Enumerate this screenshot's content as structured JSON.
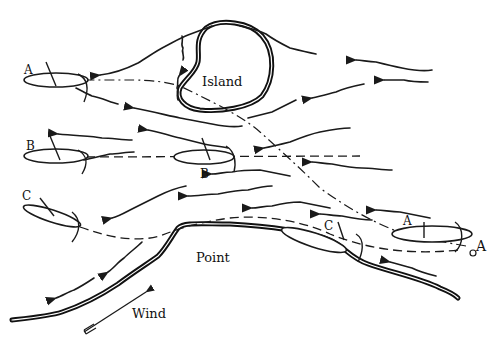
{
  "figure": {
    "landmarks": {
      "island_label": "Island",
      "point_label": "Point",
      "wind_label": "Wind"
    },
    "boats": {
      "a_start_label": "A",
      "a_end_label": "A",
      "a_mark_label": "A",
      "b_start_label": "B",
      "b_end_label": "B",
      "c_start_label": "C",
      "c_end_label": "C"
    },
    "colors": {
      "ink": "#1a1a1a",
      "background": "#ffffff"
    }
  }
}
